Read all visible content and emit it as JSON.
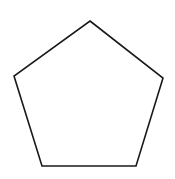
{
  "diagram": {
    "shape": "pentagon",
    "vertices": [
      [
        90,
        21
      ],
      [
        163,
        78
      ],
      [
        136,
        166
      ],
      [
        42,
        166
      ],
      [
        14,
        76
      ]
    ],
    "stroke_color": "#1a1a1a",
    "fill_color": "#ffffff",
    "stroke_width": 1.6
  }
}
